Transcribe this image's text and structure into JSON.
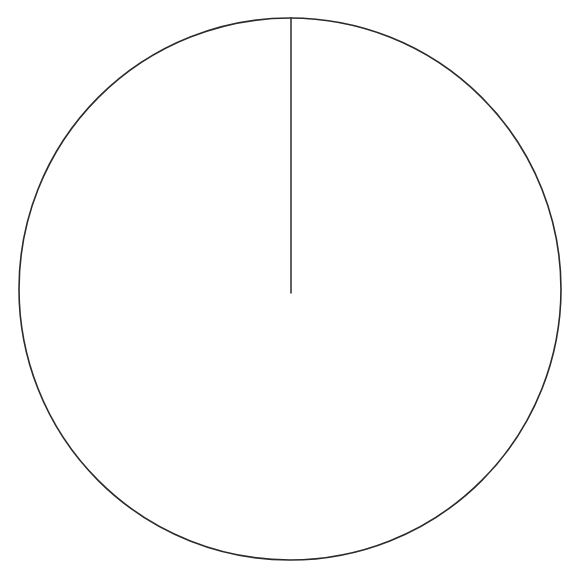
{
  "figure": {
    "background_color": "#ffffff",
    "stroke_color": "#2b2b2b",
    "canvas": {
      "width": 583,
      "height": 583
    },
    "elements": [
      {
        "name": "circle-outline",
        "type": "circle",
        "center_x": 290,
        "center_y": 289,
        "radius": 271,
        "stroke_color": "#2b2b2b",
        "stroke_width": 1.6,
        "fill": "none"
      },
      {
        "name": "radius-line",
        "type": "line",
        "x1": 291,
        "y1": 18,
        "x2": 291,
        "y2": 293,
        "stroke_color": "#2b2b2b",
        "stroke_width": 1.5,
        "orientation": "vertical",
        "from": "top of circle",
        "to": "center of circle"
      }
    ],
    "labels": [],
    "annotations": []
  },
  "chart_data": {
    "type": "diagram",
    "title": "",
    "shapes": [
      {
        "shape": "circle",
        "cx": 290,
        "cy": 289,
        "r": 271
      },
      {
        "shape": "line",
        "x1": 291,
        "y1": 18,
        "x2": 291,
        "y2": 293
      }
    ],
    "xlabel": "",
    "ylabel": "",
    "legend": [],
    "grid": false
  }
}
